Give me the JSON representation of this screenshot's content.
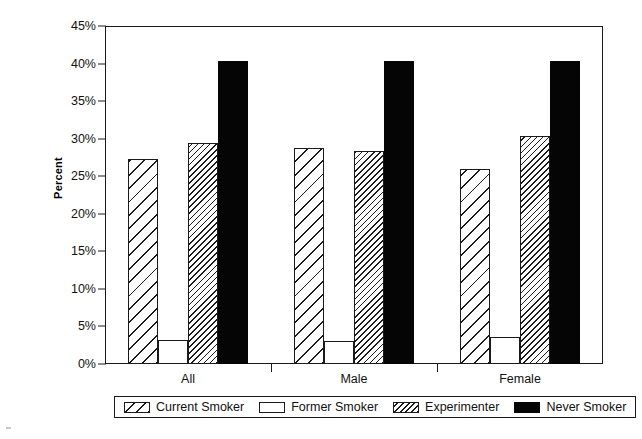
{
  "chart_data": {
    "type": "bar",
    "title": "",
    "xlabel": "",
    "ylabel": "Percent",
    "categories": [
      "All",
      "Male",
      "Female"
    ],
    "series": [
      {
        "name": "Current Smoker",
        "pattern": "diagonal-wide-hatch",
        "values": [
          27.3,
          28.7,
          26.0
        ]
      },
      {
        "name": "Former Smoker",
        "pattern": "solid-white",
        "values": [
          3.2,
          3.0,
          3.6
        ]
      },
      {
        "name": "Experimenter",
        "pattern": "diagonal-dense-hatch",
        "values": [
          29.4,
          28.3,
          30.4
        ]
      },
      {
        "name": "Never Smoker",
        "pattern": "solid-black",
        "values": [
          40.4,
          40.4,
          40.4
        ]
      }
    ],
    "ylim": [
      0,
      45
    ],
    "ytick_step": 5,
    "ytick_labels": [
      "0%",
      "5%",
      "10%",
      "15%",
      "20%",
      "25%",
      "30%",
      "35%",
      "40%",
      "45%"
    ],
    "ytick_values": [
      0,
      5,
      10,
      15,
      20,
      25,
      30,
      35,
      40,
      45
    ],
    "grid": false,
    "legend_position": "bottom",
    "legend_entries": [
      "Current Smoker",
      "Former Smoker",
      "Experimenter",
      "Never Smoker"
    ],
    "colors": {
      "axis": "#1a1a1a",
      "bar_outline": "#1a1a1a",
      "never_smoker_fill": "#050505",
      "former_smoker_fill": "#ffffff",
      "background": "#ffffff"
    }
  }
}
